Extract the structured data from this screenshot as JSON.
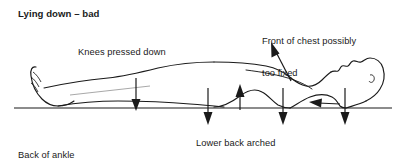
{
  "figure": {
    "title": "Lying down – bad",
    "ground_line_y": 108,
    "annotations": [
      {
        "id": "knees",
        "text": "Knees pressed down",
        "marker": "down-arrow",
        "marker_x": 136,
        "text_x": 78,
        "text_y": 47
      },
      {
        "id": "chest",
        "text": "Front of chest possibly\ntoo fixed",
        "line1": "Front of chest possibly",
        "line2": "too fixed",
        "marker": "diagonal-up-left-arrow",
        "marker_x": 290,
        "text_x": 262,
        "text_y": 15
      },
      {
        "id": "ankle",
        "text": "Back of ankle\nprobably shortened",
        "line1": "Back of ankle",
        "line2": "probably shortened",
        "marker": "none",
        "text_x": 18,
        "text_y": 129
      },
      {
        "id": "lower-back",
        "text": "Lower back arched",
        "marker": "up-arrow",
        "marker_x": 240,
        "text_x": 196,
        "text_y": 138
      }
    ],
    "arrows": [
      {
        "name": "knee-down-arrow",
        "direction": "down",
        "x": 136,
        "from_y": 78,
        "to_y": 110
      },
      {
        "name": "hip-down-arrow",
        "direction": "down",
        "x": 208,
        "from_y": 88,
        "to_y": 124
      },
      {
        "name": "lower-back-up-arrow",
        "direction": "up",
        "x": 240,
        "from_y": 110,
        "to_y": 86
      },
      {
        "name": "mid-back-down-arrow",
        "direction": "down",
        "x": 283,
        "from_y": 88,
        "to_y": 124
      },
      {
        "name": "shoulder-left-arrow",
        "direction": "left",
        "y": 104,
        "from_x": 340,
        "to_x": 310
      },
      {
        "name": "neck-down-arrow",
        "direction": "down",
        "x": 345,
        "from_y": 88,
        "to_y": 124
      },
      {
        "name": "chest-diagonal-arrow",
        "direction": "up-left-diagonal",
        "from_x": 291,
        "from_y": 82,
        "to_x": 272,
        "to_y": 45
      }
    ],
    "colors": {
      "ink": "#1a1a1a",
      "background": "#ffffff"
    }
  }
}
